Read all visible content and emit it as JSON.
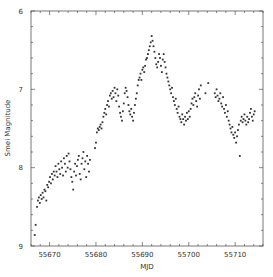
{
  "chart_data": {
    "type": "scatter",
    "title": "",
    "xlabel": "MJD",
    "ylabel": "Smei Magnitude",
    "xlim": [
      55666,
      55716
    ],
    "ylim": [
      9,
      6
    ],
    "y_inverted": true,
    "grid": false,
    "legend": null,
    "x_ticks": [
      55670,
      55680,
      55690,
      55700,
      55710
    ],
    "x_tick_labels": [
      "55670",
      "55680",
      "55690",
      "55700",
      "55710"
    ],
    "y_ticks": [
      6,
      7,
      8,
      9
    ],
    "y_tick_labels": [
      "6",
      "7",
      "8",
      "9"
    ],
    "marker_color": "#333333",
    "series": [
      {
        "name": "SMEI light curve",
        "points": [
          [
            55666.8,
            8.86
          ],
          [
            55667.0,
            8.73
          ],
          [
            55667.3,
            8.5
          ],
          [
            55667.5,
            8.42
          ],
          [
            55667.7,
            8.38
          ],
          [
            55667.9,
            8.45
          ],
          [
            55668.1,
            8.35
          ],
          [
            55668.3,
            8.4
          ],
          [
            55668.5,
            8.32
          ],
          [
            55668.7,
            8.38
          ],
          [
            55668.9,
            8.28
          ],
          [
            55669.1,
            8.3
          ],
          [
            55669.3,
            8.42
          ],
          [
            55669.5,
            8.22
          ],
          [
            55669.7,
            8.25
          ],
          [
            55669.9,
            8.18
          ],
          [
            55670.1,
            8.12
          ],
          [
            55670.3,
            8.2
          ],
          [
            55670.5,
            8.08
          ],
          [
            55670.7,
            8.15
          ],
          [
            55670.9,
            8.05
          ],
          [
            55671.1,
            8.1
          ],
          [
            55671.3,
            7.98
          ],
          [
            55671.5,
            8.05
          ],
          [
            55671.7,
            8.12
          ],
          [
            55671.9,
            7.95
          ],
          [
            55672.1,
            8.02
          ],
          [
            55672.3,
            8.08
          ],
          [
            55672.5,
            7.92
          ],
          [
            55672.7,
            8.0
          ],
          [
            55672.9,
            8.1
          ],
          [
            55673.1,
            7.88
          ],
          [
            55673.3,
            7.95
          ],
          [
            55673.5,
            8.05
          ],
          [
            55673.7,
            7.85
          ],
          [
            55673.9,
            8.0
          ],
          [
            55674.1,
            7.82
          ],
          [
            55674.3,
            7.92
          ],
          [
            55674.5,
            8.02
          ],
          [
            55674.7,
            8.12
          ],
          [
            55674.9,
            8.18
          ],
          [
            55675.1,
            8.28
          ],
          [
            55675.3,
            8.05
          ],
          [
            55675.5,
            7.95
          ],
          [
            55675.7,
            8.1
          ],
          [
            55675.9,
            7.98
          ],
          [
            55676.1,
            7.9
          ],
          [
            55676.3,
            7.85
          ],
          [
            55676.5,
            8.08
          ],
          [
            55676.7,
            8.15
          ],
          [
            55676.9,
            7.95
          ],
          [
            55677.1,
            7.88
          ],
          [
            55677.3,
            7.8
          ],
          [
            55677.5,
            8.02
          ],
          [
            55677.7,
            7.92
          ],
          [
            55677.9,
            8.12
          ],
          [
            55678.1,
            7.85
          ],
          [
            55678.3,
            7.95
          ],
          [
            55678.5,
            8.05
          ],
          [
            55678.7,
            7.9
          ],
          [
            55679.8,
            7.75
          ],
          [
            55680.0,
            7.68
          ],
          [
            55680.2,
            7.55
          ],
          [
            55680.4,
            7.5
          ],
          [
            55680.6,
            7.52
          ],
          [
            55680.8,
            7.48
          ],
          [
            55681.0,
            7.45
          ],
          [
            55681.2,
            7.5
          ],
          [
            55681.4,
            7.42
          ],
          [
            55681.6,
            7.35
          ],
          [
            55681.8,
            7.3
          ],
          [
            55682.0,
            7.25
          ],
          [
            55682.2,
            7.32
          ],
          [
            55682.4,
            7.2
          ],
          [
            55682.6,
            7.15
          ],
          [
            55682.8,
            7.22
          ],
          [
            55683.0,
            7.08
          ],
          [
            55683.2,
            7.05
          ],
          [
            55683.4,
            7.12
          ],
          [
            55683.6,
            7.02
          ],
          [
            55683.8,
            7.1
          ],
          [
            55684.0,
            6.98
          ],
          [
            55684.2,
            7.05
          ],
          [
            55684.4,
            7.15
          ],
          [
            55684.6,
            7.0
          ],
          [
            55684.8,
            7.08
          ],
          [
            55685.0,
            7.22
          ],
          [
            55685.2,
            7.3
          ],
          [
            55685.4,
            7.35
          ],
          [
            55685.6,
            7.4
          ],
          [
            55685.8,
            7.28
          ],
          [
            55686.0,
            7.18
          ],
          [
            55686.2,
            7.05
          ],
          [
            55686.4,
            6.98
          ],
          [
            55686.6,
            7.02
          ],
          [
            55686.8,
            7.1
          ],
          [
            55687.0,
            7.2
          ],
          [
            55687.2,
            7.28
          ],
          [
            55687.4,
            7.32
          ],
          [
            55687.6,
            7.25
          ],
          [
            55687.8,
            7.35
          ],
          [
            55688.0,
            7.4
          ],
          [
            55688.2,
            7.3
          ],
          [
            55688.4,
            7.2
          ],
          [
            55688.6,
            7.12
          ],
          [
            55688.8,
            7.05
          ],
          [
            55689.0,
            6.95
          ],
          [
            55689.2,
            6.88
          ],
          [
            55689.4,
            6.85
          ],
          [
            55689.6,
            6.8
          ],
          [
            55689.8,
            6.88
          ],
          [
            55690.0,
            6.75
          ],
          [
            55690.2,
            6.72
          ],
          [
            55690.4,
            6.78
          ],
          [
            55690.6,
            6.7
          ],
          [
            55690.8,
            6.62
          ],
          [
            55691.0,
            6.6
          ],
          [
            55691.2,
            6.55
          ],
          [
            55691.4,
            6.5
          ],
          [
            55691.6,
            6.45
          ],
          [
            55691.8,
            6.4
          ],
          [
            55692.0,
            6.32
          ],
          [
            55692.2,
            6.38
          ],
          [
            55692.4,
            6.45
          ],
          [
            55692.6,
            6.52
          ],
          [
            55692.8,
            6.6
          ],
          [
            55693.0,
            6.68
          ],
          [
            55693.2,
            6.72
          ],
          [
            55693.4,
            6.65
          ],
          [
            55693.6,
            6.55
          ],
          [
            55693.8,
            6.6
          ],
          [
            55694.0,
            6.7
          ],
          [
            55694.2,
            6.78
          ],
          [
            55694.4,
            6.62
          ],
          [
            55694.6,
            6.55
          ],
          [
            55694.8,
            6.65
          ],
          [
            55695.0,
            6.72
          ],
          [
            55695.2,
            6.8
          ],
          [
            55695.4,
            6.85
          ],
          [
            55695.6,
            6.9
          ],
          [
            55695.8,
            6.95
          ],
          [
            55696.0,
            7.0
          ],
          [
            55696.2,
            7.05
          ],
          [
            55696.4,
            6.98
          ],
          [
            55696.6,
            7.1
          ],
          [
            55696.8,
            7.15
          ],
          [
            55697.0,
            7.2
          ],
          [
            55697.2,
            7.12
          ],
          [
            55697.4,
            7.25
          ],
          [
            55697.6,
            7.3
          ],
          [
            55697.8,
            7.22
          ],
          [
            55698.0,
            7.35
          ],
          [
            55698.2,
            7.38
          ],
          [
            55698.4,
            7.42
          ],
          [
            55698.6,
            7.32
          ],
          [
            55698.8,
            7.38
          ],
          [
            55699.0,
            7.45
          ],
          [
            55699.2,
            7.35
          ],
          [
            55699.4,
            7.4
          ],
          [
            55699.6,
            7.3
          ],
          [
            55699.8,
            7.38
          ],
          [
            55700.0,
            7.28
          ],
          [
            55700.2,
            7.35
          ],
          [
            55700.4,
            7.25
          ],
          [
            55700.6,
            7.18
          ],
          [
            55700.8,
            7.12
          ],
          [
            55701.0,
            7.2
          ],
          [
            55701.2,
            7.1
          ],
          [
            55701.4,
            7.05
          ],
          [
            55701.6,
            7.15
          ],
          [
            55701.8,
            7.22
          ],
          [
            55702.0,
            7.08
          ],
          [
            55702.2,
            7.0
          ],
          [
            55702.4,
            7.12
          ],
          [
            55702.6,
            6.95
          ],
          [
            55703.6,
            7.05
          ],
          [
            55704.2,
            6.92
          ],
          [
            55705.6,
            7.05
          ],
          [
            55705.8,
            7.1
          ],
          [
            55706.0,
            7.0
          ],
          [
            55706.2,
            7.08
          ],
          [
            55706.4,
            7.15
          ],
          [
            55706.6,
            7.12
          ],
          [
            55706.8,
            7.05
          ],
          [
            55707.0,
            7.18
          ],
          [
            55707.2,
            7.22
          ],
          [
            55707.4,
            7.1
          ],
          [
            55707.6,
            7.25
          ],
          [
            55707.8,
            7.3
          ],
          [
            55708.0,
            7.2
          ],
          [
            55708.2,
            7.35
          ],
          [
            55708.4,
            7.28
          ],
          [
            55708.6,
            7.4
          ],
          [
            55708.8,
            7.45
          ],
          [
            55709.0,
            7.5
          ],
          [
            55709.2,
            7.55
          ],
          [
            55709.4,
            7.48
          ],
          [
            55709.6,
            7.58
          ],
          [
            55709.8,
            7.62
          ],
          [
            55710.0,
            7.55
          ],
          [
            55710.2,
            7.68
          ],
          [
            55710.4,
            7.6
          ],
          [
            55710.6,
            7.52
          ],
          [
            55710.8,
            7.45
          ],
          [
            55711.0,
            7.85
          ],
          [
            55711.2,
            7.4
          ],
          [
            55711.4,
            7.35
          ],
          [
            55711.6,
            7.42
          ],
          [
            55711.8,
            7.38
          ],
          [
            55712.0,
            7.32
          ],
          [
            55712.2,
            7.4
          ],
          [
            55712.4,
            7.45
          ],
          [
            55712.6,
            7.35
          ],
          [
            55712.8,
            7.42
          ],
          [
            55713.0,
            7.38
          ],
          [
            55713.2,
            7.3
          ],
          [
            55713.4,
            7.25
          ],
          [
            55713.6,
            7.35
          ],
          [
            55713.8,
            7.4
          ],
          [
            55714.0,
            7.32
          ],
          [
            55714.2,
            7.28
          ]
        ]
      }
    ]
  }
}
